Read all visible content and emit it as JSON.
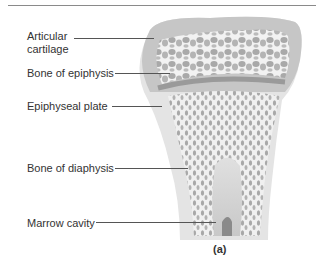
{
  "figure": {
    "caption": "(a)",
    "labels": [
      {
        "id": "articular-cartilage",
        "line1": "Articular",
        "line2": "cartilage"
      },
      {
        "id": "bone-of-epiphysis",
        "text": "Bone of epiphysis"
      },
      {
        "id": "epiphyseal-plate",
        "text": "Epiphyseal plate"
      },
      {
        "id": "bone-of-diaphysis",
        "text": "Bone of diaphysis"
      },
      {
        "id": "marrow-cavity",
        "text": "Marrow cavity"
      }
    ],
    "colors": {
      "cartilage": "#c8c8c8",
      "spongy_bone": "#b0b0b0",
      "cortical": "#e6e6e6",
      "marrow": "#d4d4d4",
      "leader": "#555555"
    }
  }
}
